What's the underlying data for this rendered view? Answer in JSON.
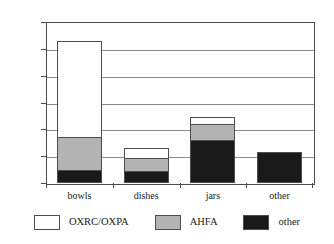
{
  "chart_data": {
    "type": "bar",
    "stacked": true,
    "orientation": "vertical",
    "title": "",
    "subtitle": "",
    "xlabel": "",
    "ylabel": "",
    "categories": [
      "bowls",
      "dishes",
      "jars",
      "other"
    ],
    "series": [
      {
        "name": "OXRC/OXPA",
        "color": "#ffffff",
        "values": [
          1.79,
          0.19,
          0.13,
          0.0
        ]
      },
      {
        "name": "AHFA",
        "color": "#b3b3b3",
        "values": [
          0.62,
          0.24,
          0.3,
          0.0
        ]
      },
      {
        "name": "other",
        "color": "#1a1a1a",
        "values": [
          0.24,
          0.22,
          0.8,
          0.58
        ]
      }
    ],
    "cumulative_tops": {
      "bowls": {
        "other": 0.24,
        "AHFA": 0.86,
        "OXRC/OXPA": 2.65
      },
      "dishes": {
        "other": 0.22,
        "AHFA": 0.46,
        "OXRC/OXPA": 0.65
      },
      "jars": {
        "other": 0.8,
        "AHFA": 1.1,
        "OXRC/OXPA": 1.23
      },
      "other": {
        "other": 0.58,
        "AHFA": 0.58,
        "OXRC/OXPA": 0.58
      }
    },
    "totals": [
      2.65,
      0.65,
      1.23,
      0.58
    ],
    "ylim": [
      0,
      3
    ],
    "ytick_values": [
      0,
      0.5,
      1,
      1.5,
      2,
      2.5,
      3
    ],
    "ytick_labels": [
      "0",
      "0.5",
      "1",
      "1.5",
      "2",
      "2.5",
      "3"
    ],
    "grid": true,
    "grid_axis": "y",
    "legend_position": "bottom",
    "legend_entries": [
      "OXRC/OXPA",
      "AHFA",
      "other"
    ],
    "colors": {
      "series_oxrc_oxpa": "#ffffff",
      "series_ahfa": "#b3b3b3",
      "series_other": "#1a1a1a",
      "axis": "#4d4d4d",
      "gridline": "#8c8c8c",
      "background": "#ffffff",
      "text": "#1a1a1a"
    }
  }
}
